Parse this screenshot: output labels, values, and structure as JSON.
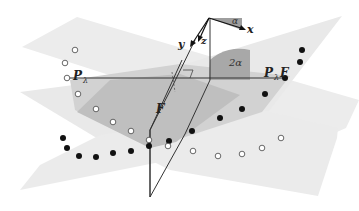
{
  "figure": {
    "type": "geometric-diagram",
    "colors": {
      "back_plane": "#ececec",
      "front_plane": "#e6e6e6",
      "overlap_dark": "#b9b9b9",
      "overlap_mid": "#cfcfcf",
      "wedge_alpha": "#9a9a9a",
      "wedge_2alpha": "#a9a9a9",
      "line": "#333333",
      "point_filled": "#111111",
      "point_open_stroke": "#444444"
    }
  },
  "labels": {
    "p_lambda": "P",
    "p_lambda_sub": "λ",
    "p_lambda_f": "P",
    "p_lambda_f_sub": "λ",
    "p_lambda_f_suffix": "F",
    "f": "F",
    "alpha": "α",
    "two_alpha": "2α",
    "axis_x": "x",
    "axis_y": "y",
    "axis_z": "z"
  },
  "points": {
    "open_left_arc": [
      [
        75,
        50
      ],
      [
        65,
        63
      ],
      [
        67,
        78
      ],
      [
        78,
        94
      ],
      [
        96,
        109
      ],
      [
        113,
        122
      ],
      [
        131,
        131
      ],
      [
        149,
        140
      ]
    ],
    "filled_left_arc": [
      [
        63,
        138
      ],
      [
        67,
        148
      ],
      [
        79,
        156
      ],
      [
        96,
        157
      ],
      [
        113,
        153
      ],
      [
        131,
        151
      ],
      [
        149,
        146
      ],
      [
        169,
        141
      ]
    ],
    "filled_right_arc": [
      [
        308,
        50
      ],
      [
        307,
        62
      ],
      [
        284,
        78
      ],
      [
        265,
        93
      ],
      [
        242,
        108
      ],
      [
        220,
        118
      ],
      [
        192,
        131
      ]
    ],
    "open_right_arc": [
      [
        169,
        146
      ],
      [
        193,
        151
      ],
      [
        218,
        156
      ],
      [
        242,
        154
      ],
      [
        262,
        148
      ],
      [
        281,
        137
      ]
    ]
  }
}
